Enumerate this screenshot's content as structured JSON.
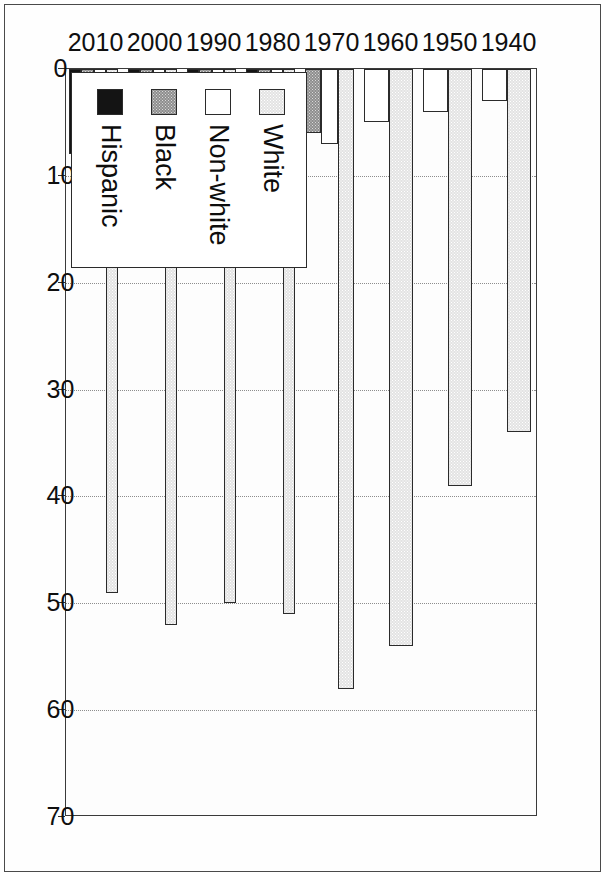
{
  "chart_data": {
    "type": "bar",
    "orientation": "horizontal-rotated",
    "title": "",
    "subtitle": "",
    "xlabel": "",
    "ylabel": "",
    "categories": [
      "1940",
      "1950",
      "1960",
      "1970",
      "1980",
      "1990",
      "2000",
      "2010"
    ],
    "series": [
      {
        "name": "White",
        "values": [
          34,
          39,
          54,
          58,
          51,
          50,
          52,
          49
        ]
      },
      {
        "name": "Non-white",
        "values": [
          3,
          4,
          5,
          7,
          7.5,
          11,
          10.5,
          13
        ]
      },
      {
        "name": "Black",
        "values": [
          0,
          0,
          0,
          6,
          6,
          9,
          8,
          8.5
        ]
      },
      {
        "name": "Hispanic",
        "values": [
          0,
          0,
          0,
          0,
          9,
          11,
          6.5,
          8
        ]
      }
    ],
    "value_axis": {
      "min": 0,
      "max": 70,
      "ticks": [
        "70",
        "60",
        "50",
        "40",
        "30",
        "20",
        "10",
        "0"
      ],
      "tick_values": [
        70,
        60,
        50,
        40,
        30,
        20,
        10,
        0
      ],
      "direction": "reversed"
    },
    "grid": true,
    "legend": {
      "position": "bottom-left",
      "entries": [
        {
          "label": "White",
          "swatch": "light-gray-dotted",
          "color": "#e3e3e3"
        },
        {
          "label": "Non-white",
          "swatch": "white",
          "color": "#ffffff"
        },
        {
          "label": "Black",
          "swatch": "medium-gray",
          "color": "#8e8e8e"
        },
        {
          "label": "Hispanic",
          "swatch": "solid-black",
          "color": "#141414"
        }
      ]
    }
  },
  "axis_ticks": {
    "t0": "70",
    "t1": "60",
    "t2": "50",
    "t3": "40",
    "t4": "30",
    "t5": "20",
    "t6": "10",
    "t7": "0"
  },
  "categories": {
    "c0": "1940",
    "c1": "1950",
    "c2": "1960",
    "c3": "1970",
    "c4": "1980",
    "c5": "1990",
    "c6": "2000",
    "c7": "2010"
  },
  "legend_labels": {
    "l0": "White",
    "l1": "Non-white",
    "l2": "Black",
    "l3": "Hispanic"
  }
}
